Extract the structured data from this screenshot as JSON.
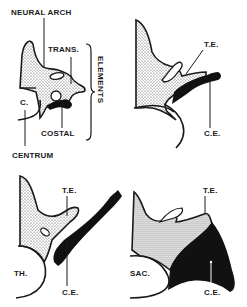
{
  "diagram": {
    "type": "anatomical-illustration",
    "panels": [
      {
        "id": "generic",
        "labels": {
          "neural_arch": "NEURAL ARCH",
          "trans": "TRANS.",
          "elements": "ELEMENTS",
          "c": "C.",
          "costal": "COSTAL",
          "centrum": "CENTRUM"
        }
      },
      {
        "id": "cervical",
        "labels": {
          "te": "T.E.",
          "ce": "C.E."
        }
      },
      {
        "id": "thoracic",
        "labels": {
          "th": "TH.",
          "te": "T.E.",
          "ce": "C.E."
        }
      },
      {
        "id": "sacral",
        "labels": {
          "sac": "SAC.",
          "te": "T.E.",
          "ce": "C.E."
        }
      }
    ],
    "colors": {
      "ink": "#1a1a1a",
      "stipple": "#b8b8b8",
      "background": "#ffffff"
    }
  }
}
